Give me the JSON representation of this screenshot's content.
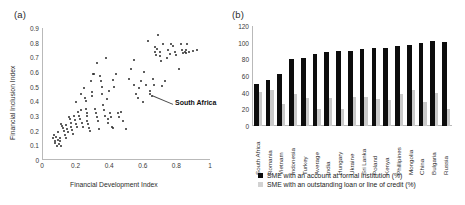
{
  "figure": {
    "panel_a_label": "(a)",
    "panel_b_label": "(b)"
  },
  "chart_data": [
    {
      "id": "panel_a",
      "type": "scatter",
      "title": "(a)",
      "xlabel": "Financial Development Index",
      "ylabel": "Financial Inclusion Index",
      "xlim": [
        0,
        1
      ],
      "ylim": [
        0,
        0.9
      ],
      "xticks": [
        "0",
        "0.2",
        "0.4",
        "0.6",
        "0.8",
        "1"
      ],
      "xtick_values": [
        0,
        0.2,
        0.4,
        0.6,
        0.8,
        1
      ],
      "yticks": [
        "0",
        "0.1",
        "0.2",
        "0.3",
        "0.4",
        "0.5",
        "0.6",
        "0.7",
        "0.8",
        "0.9"
      ],
      "ytick_values": [
        0,
        0.1,
        0.2,
        0.3,
        0.4,
        0.5,
        0.6,
        0.7,
        0.8,
        0.9
      ],
      "grid": false,
      "legend": "none",
      "annotations": [
        {
          "text": "South Africa",
          "point_x": 0.655,
          "point_y": 0.445,
          "label_x": 0.78,
          "label_y": 0.385
        }
      ],
      "points": [
        [
          0.065,
          0.155
        ],
        [
          0.07,
          0.175
        ],
        [
          0.075,
          0.135
        ],
        [
          0.08,
          0.12
        ],
        [
          0.085,
          0.165
        ],
        [
          0.09,
          0.105
        ],
        [
          0.093,
          0.145
        ],
        [
          0.097,
          0.195
        ],
        [
          0.1,
          0.115
        ],
        [
          0.105,
          0.16
        ],
        [
          0.108,
          0.135
        ],
        [
          0.112,
          0.105
        ],
        [
          0.115,
          0.255
        ],
        [
          0.12,
          0.24
        ],
        [
          0.125,
          0.225
        ],
        [
          0.13,
          0.205
        ],
        [
          0.135,
          0.175
        ],
        [
          0.14,
          0.155
        ],
        [
          0.145,
          0.245
        ],
        [
          0.15,
          0.22
        ],
        [
          0.155,
          0.195
        ],
        [
          0.16,
          0.3
        ],
        [
          0.165,
          0.285
        ],
        [
          0.17,
          0.26
        ],
        [
          0.175,
          0.235
        ],
        [
          0.18,
          0.21
        ],
        [
          0.185,
          0.185
        ],
        [
          0.19,
          0.305
        ],
        [
          0.195,
          0.28
        ],
        [
          0.2,
          0.4
        ],
        [
          0.205,
          0.255
        ],
        [
          0.21,
          0.23
        ],
        [
          0.215,
          0.335
        ],
        [
          0.22,
          0.31
        ],
        [
          0.225,
          0.285
        ],
        [
          0.23,
          0.455
        ],
        [
          0.235,
          0.345
        ],
        [
          0.24,
          0.26
        ],
        [
          0.245,
          0.235
        ],
        [
          0.25,
          0.5
        ],
        [
          0.255,
          0.43
        ],
        [
          0.26,
          0.41
        ],
        [
          0.262,
          0.355
        ],
        [
          0.265,
          0.33
        ],
        [
          0.268,
          0.305
        ],
        [
          0.27,
          0.275
        ],
        [
          0.275,
          0.25
        ],
        [
          0.28,
          0.225
        ],
        [
          0.285,
          0.205
        ],
        [
          0.29,
          0.545
        ],
        [
          0.295,
          0.44
        ],
        [
          0.3,
          0.47
        ],
        [
          0.305,
          0.59
        ],
        [
          0.31,
          0.59
        ],
        [
          0.315,
          0.355
        ],
        [
          0.32,
          0.325
        ],
        [
          0.325,
          0.3
        ],
        [
          0.33,
          0.665
        ],
        [
          0.335,
          0.275
        ],
        [
          0.34,
          0.215
        ],
        [
          0.345,
          0.58
        ],
        [
          0.35,
          0.545
        ],
        [
          0.355,
          0.505
        ],
        [
          0.36,
          0.455
        ],
        [
          0.365,
          0.38
        ],
        [
          0.37,
          0.345
        ],
        [
          0.375,
          0.31
        ],
        [
          0.38,
          0.7
        ],
        [
          0.385,
          0.42
        ],
        [
          0.39,
          0.285
        ],
        [
          0.395,
          0.26
        ],
        [
          0.4,
          0.475
        ],
        [
          0.405,
          0.33
        ],
        [
          0.41,
          0.3
        ],
        [
          0.415,
          0.235
        ],
        [
          0.42,
          0.555
        ],
        [
          0.425,
          0.225
        ],
        [
          0.43,
          0.505
        ],
        [
          0.44,
          0.595
        ],
        [
          0.45,
          0.325
        ],
        [
          0.46,
          0.3
        ],
        [
          0.47,
          0.335
        ],
        [
          0.48,
          0.275
        ],
        [
          0.5,
          0.215
        ],
        [
          0.52,
          0.56
        ],
        [
          0.53,
          0.625
        ],
        [
          0.545,
          0.69
        ],
        [
          0.55,
          0.52
        ],
        [
          0.56,
          0.46
        ],
        [
          0.57,
          0.43
        ],
        [
          0.58,
          0.5
        ],
        [
          0.59,
          0.545
        ],
        [
          0.6,
          0.4
        ],
        [
          0.605,
          0.605
        ],
        [
          0.62,
          0.52
        ],
        [
          0.63,
          0.82
        ],
        [
          0.64,
          0.475
        ],
        [
          0.645,
          0.455
        ],
        [
          0.655,
          0.445
        ],
        [
          0.66,
          0.56
        ],
        [
          0.665,
          0.52
        ],
        [
          0.67,
          0.78
        ],
        [
          0.675,
          0.745
        ],
        [
          0.68,
          0.72
        ],
        [
          0.685,
          0.765
        ],
        [
          0.69,
          0.86
        ],
        [
          0.7,
          0.74
        ],
        [
          0.705,
          0.715
        ],
        [
          0.71,
          0.68
        ],
        [
          0.715,
          0.51
        ],
        [
          0.72,
          0.8
        ],
        [
          0.73,
          0.545
        ],
        [
          0.745,
          0.7
        ],
        [
          0.75,
          0.755
        ],
        [
          0.76,
          0.73
        ],
        [
          0.77,
          0.8
        ],
        [
          0.78,
          0.785
        ],
        [
          0.79,
          0.745
        ],
        [
          0.8,
          0.72
        ],
        [
          0.815,
          0.625
        ],
        [
          0.825,
          0.8
        ],
        [
          0.835,
          0.755
        ],
        [
          0.84,
          0.735
        ],
        [
          0.85,
          0.745
        ],
        [
          0.855,
          0.76
        ],
        [
          0.86,
          0.735
        ],
        [
          0.865,
          0.8
        ],
        [
          0.875,
          0.745
        ],
        [
          0.9,
          0.75
        ],
        [
          0.92,
          0.755
        ]
      ]
    },
    {
      "id": "panel_b",
      "type": "bar",
      "title": "(b)",
      "xlabel": "",
      "ylabel": "",
      "ylim": [
        0,
        120
      ],
      "yticks": [
        "0",
        "20",
        "40",
        "60",
        "80",
        "100",
        "120"
      ],
      "ytick_values": [
        0,
        20,
        40,
        60,
        80,
        100,
        120
      ],
      "grid": false,
      "legend_position": "bottom",
      "categories": [
        "South Africa",
        "Romania",
        "Vietnam",
        "Indonesia",
        "Turkey",
        "Average",
        "India",
        "Hungary",
        "Ukraine",
        "Sri Lanka",
        "Poland",
        "Kenya",
        "Phillipines",
        "Mongolia",
        "China",
        "Bulgaria",
        "Russia"
      ],
      "series": [
        {
          "name": "SME with an account at formal institution (%)",
          "color": "#0d0d0d",
          "values": [
            51,
            55,
            62,
            81,
            82,
            87,
            89,
            90,
            90,
            93,
            94,
            94,
            96,
            97,
            100,
            102,
            101
          ]
        },
        {
          "name": "SME with an outstanding loan or line of credit (%)",
          "color": "#c9c9c9",
          "values": [
            41,
            43,
            27,
            38,
            34,
            21,
            34,
            21,
            35,
            35,
            33,
            31,
            38,
            43,
            29,
            40,
            21
          ]
        }
      ]
    }
  ]
}
